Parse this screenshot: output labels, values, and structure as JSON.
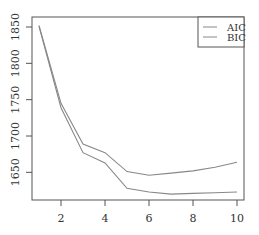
{
  "chart_data": {
    "type": "line",
    "title": "",
    "xlabel": "",
    "ylabel": "",
    "x": [
      1,
      2,
      3,
      4,
      5,
      6,
      7,
      8,
      9,
      10
    ],
    "series": [
      {
        "name": "AIC",
        "values": [
          1851,
          1739,
          1677,
          1663,
          1628,
          1623,
          1620,
          1621,
          1622,
          1623
        ],
        "color": "#888888"
      },
      {
        "name": "BIC",
        "values": [
          1852,
          1745,
          1689,
          1677,
          1651,
          1646,
          1649,
          1652,
          1657,
          1664
        ],
        "color": "#888888"
      }
    ],
    "xticks": [
      2,
      4,
      6,
      8,
      10
    ],
    "yticks": [
      1650,
      1700,
      1750,
      1800,
      1850
    ],
    "xlim": [
      0.65,
      10.3
    ],
    "ylim": [
      1603,
      1864
    ],
    "grid": false,
    "legend": {
      "position": "top-right",
      "entries": [
        "AIC",
        "BIC"
      ]
    }
  },
  "legend": {
    "aic_label": "AIC",
    "bic_label": "BIC"
  },
  "axes": {
    "x_tick_labels": [
      "2",
      "4",
      "6",
      "8",
      "10"
    ],
    "y_tick_labels": [
      "1650",
      "1700",
      "1750",
      "1800",
      "1850"
    ]
  },
  "colors": {
    "axis": "#555555",
    "line": "#888888",
    "text": "#333333"
  }
}
